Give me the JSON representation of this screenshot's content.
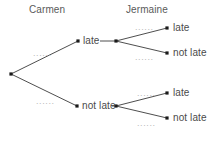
{
  "diagram": {
    "type": "probability-tree",
    "background_color": "#ffffff",
    "line_color": "#3a3a3a",
    "node_color": "#1a1a1a",
    "text_color": "#4a4a4a",
    "headers": [
      {
        "id": "carmen",
        "label": "Carmen",
        "x": 29,
        "y": 4
      },
      {
        "id": "jermaine",
        "label": "Jermaine",
        "x": 126,
        "y": 4
      }
    ],
    "nodes": [
      {
        "id": "root",
        "x": 11,
        "y": 74,
        "label": ""
      },
      {
        "id": "carmen-late",
        "x": 78,
        "y": 41,
        "label": "late",
        "label_x": 83,
        "label_y": 35
      },
      {
        "id": "carmen-not-late",
        "x": 77,
        "y": 106,
        "label": "not late",
        "label_x": 82,
        "label_y": 100
      },
      {
        "id": "jermaine-top-branch",
        "x": 116,
        "y": 41,
        "label": ""
      },
      {
        "id": "jermaine-bottom-branch",
        "x": 116,
        "y": 106,
        "label": ""
      },
      {
        "id": "jermaine-late-1",
        "x": 167,
        "y": 28,
        "label": "late",
        "label_x": 173,
        "label_y": 22
      },
      {
        "id": "jermaine-not-late-1",
        "x": 167,
        "y": 53,
        "label": "not late",
        "label_x": 173,
        "label_y": 47
      },
      {
        "id": "jermaine-late-2",
        "x": 167,
        "y": 93,
        "label": "late",
        "label_x": 173,
        "label_y": 87
      },
      {
        "id": "jermaine-not-late-2",
        "x": 167,
        "y": 118,
        "label": "not late",
        "label_x": 173,
        "label_y": 112
      }
    ],
    "edges": [
      {
        "id": "root-to-carmen-late",
        "from": "root",
        "to": "carmen-late",
        "x1": 11,
        "y1": 74,
        "x2": 78,
        "y2": 41
      },
      {
        "id": "root-to-carmen-not-late",
        "from": "root",
        "to": "carmen-not-late",
        "x1": 11,
        "y1": 74,
        "x2": 77,
        "y2": 106
      },
      {
        "id": "carmen-late-to-jermaine-branch",
        "from": "carmen-late",
        "to": "jermaine-top-branch",
        "x1": 100,
        "y1": 41,
        "x2": 116,
        "y2": 41
      },
      {
        "id": "carmen-not-late-to-jermaine-branch",
        "from": "carmen-not-late",
        "to": "jermaine-bottom-branch",
        "x1": 112,
        "y1": 106,
        "x2": 116,
        "y2": 106
      },
      {
        "id": "jermaine-top-to-late",
        "from": "jermaine-top-branch",
        "to": "jermaine-late-1",
        "x1": 116,
        "y1": 41,
        "x2": 167,
        "y2": 28
      },
      {
        "id": "jermaine-top-to-not-late",
        "from": "jermaine-top-branch",
        "to": "jermaine-not-late-1",
        "x1": 116,
        "y1": 41,
        "x2": 167,
        "y2": 53
      },
      {
        "id": "jermaine-bottom-to-late",
        "from": "jermaine-bottom-branch",
        "to": "jermaine-late-2",
        "x1": 116,
        "y1": 106,
        "x2": 167,
        "y2": 93
      },
      {
        "id": "jermaine-bottom-to-not-late",
        "from": "jermaine-bottom-branch",
        "to": "jermaine-not-late-2",
        "x1": 116,
        "y1": 106,
        "x2": 167,
        "y2": 118
      }
    ],
    "edge_labels": [
      {
        "id": "label-carmen-late",
        "text": "......",
        "x": 33,
        "y": 48,
        "for_edge": "root-to-carmen-late"
      },
      {
        "id": "label-carmen-not-late",
        "text": "......",
        "x": 36,
        "y": 96,
        "for_edge": "root-to-carmen-not-late"
      },
      {
        "id": "label-jermaine-late-1",
        "text": "......",
        "x": 135,
        "y": 22,
        "for_edge": "jermaine-top-to-late"
      },
      {
        "id": "label-jermaine-not-late-1",
        "text": "......",
        "x": 135,
        "y": 52,
        "for_edge": "jermaine-top-to-not-late"
      },
      {
        "id": "label-jermaine-late-2",
        "text": "......",
        "x": 137,
        "y": 88,
        "for_edge": "jermaine-bottom-to-late"
      },
      {
        "id": "label-jermaine-not-late-2",
        "text": "......",
        "x": 137,
        "y": 118,
        "for_edge": "jermaine-bottom-to-not-late"
      }
    ]
  }
}
